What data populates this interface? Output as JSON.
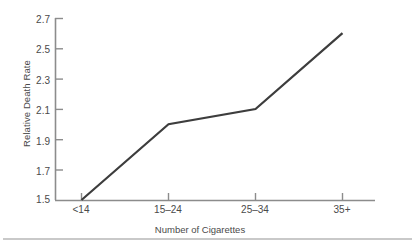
{
  "chart_data": {
    "type": "line",
    "title": "",
    "xlabel": "Number of Cigarettes",
    "ylabel": "Relative Death Rate",
    "categories": [
      "<14",
      "15–24",
      "25–34",
      "35+"
    ],
    "values": [
      1.5,
      2.0,
      2.1,
      2.6
    ],
    "series": [
      {
        "name": "Relative Death Rate",
        "values": [
          1.5,
          2.0,
          2.1,
          2.6
        ]
      }
    ],
    "ylim": [
      1.5,
      2.7
    ],
    "ytick_labels": [
      "1.5",
      "1.7",
      "1.9",
      "2.1",
      "2.3",
      "2.5",
      "2.7"
    ],
    "ytick_values": [
      1.5,
      1.7,
      1.9,
      2.1,
      2.3,
      2.5,
      2.7
    ],
    "xtick_labels": [
      "<14",
      "15–24",
      "25–34",
      "35+"
    ],
    "grid": false,
    "legend": false,
    "legend_position": "none",
    "line_color": "#3d3d3d",
    "axis_color": "#8c8c8c",
    "rule_color": "#c9c9c9",
    "background": "#ffffff"
  }
}
